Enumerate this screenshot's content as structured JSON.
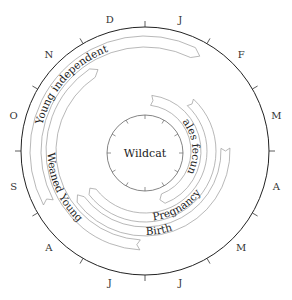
{
  "diagram": {
    "title": "Wildcat",
    "months": [
      "J",
      "F",
      "M",
      "A",
      "M",
      "J",
      "J",
      "A",
      "S",
      "O",
      "N",
      "D"
    ],
    "bands": [
      {
        "label": "Young independent",
        "start_deg": 242,
        "end_deg": 390,
        "r_inner": 104,
        "r_outer": 115,
        "label_mid_deg": 312
      },
      {
        "label": "Weaned Young",
        "start_deg": 183,
        "end_deg": 330,
        "r_inner": 89,
        "r_outer": 99,
        "label_mid_deg": 246
      },
      {
        "label": "Birth",
        "start_deg": 88,
        "end_deg": 237,
        "r_inner": 76,
        "r_outer": 85,
        "label_mid_deg": 170
      },
      {
        "label": "Pregnancy",
        "start_deg": 43,
        "end_deg": 236,
        "r_inner": 62,
        "r_outer": 71,
        "label_mid_deg": 150
      },
      {
        "label": "Males fecund",
        "start_deg": 7,
        "end_deg": 163,
        "r_inner": 46,
        "r_outer": 56,
        "label_mid_deg": 82
      }
    ]
  }
}
